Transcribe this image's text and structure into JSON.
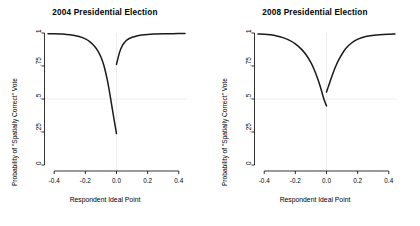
{
  "figure": {
    "background": "#ffffff",
    "curve_color": "#1a1a1a",
    "grid_color": "#e8e8e8"
  },
  "chart_data": [
    {
      "type": "line",
      "title": "2004 Presidential Election",
      "xlabel": "Respondent Ideal Point",
      "ylabel": "Probability of \"Spatially Correct\" Vote",
      "xlim": [
        -0.44,
        0.44
      ],
      "ylim": [
        0,
        1
      ],
      "xticks": [
        -0.4,
        -0.2,
        0.0,
        0.2,
        0.4
      ],
      "xtick_labels": [
        "-0.4",
        "-0.2",
        "0.0",
        "0.2",
        "0.4"
      ],
      "yticks": [
        0,
        0.25,
        0.5,
        0.75,
        1
      ],
      "ytick_labels": [
        "0",
        ".25",
        ".5",
        ".75",
        "1"
      ],
      "grid": true,
      "gridlines": {
        "horizontal": [
          0.5
        ],
        "vertical": [
          0.0
        ]
      },
      "legend": null,
      "discontinuity_at_x": 0.0,
      "series": [
        {
          "name": "left-branch-2004",
          "x": [
            -0.44,
            -0.4,
            -0.36,
            -0.32,
            -0.28,
            -0.24,
            -0.2,
            -0.17,
            -0.14,
            -0.12,
            -0.1,
            -0.08,
            -0.06,
            -0.04,
            -0.02,
            0.0
          ],
          "y": [
            0.995,
            0.994,
            0.992,
            0.989,
            0.983,
            0.973,
            0.955,
            0.933,
            0.898,
            0.865,
            0.818,
            0.75,
            0.65,
            0.52,
            0.375,
            0.238
          ]
        },
        {
          "name": "right-branch-2004",
          "x": [
            0.0,
            0.02,
            0.04,
            0.06,
            0.08,
            0.1,
            0.13,
            0.16,
            0.2,
            0.25,
            0.3,
            0.36,
            0.44
          ],
          "y": [
            0.762,
            0.855,
            0.91,
            0.94,
            0.957,
            0.968,
            0.978,
            0.984,
            0.989,
            0.992,
            0.994,
            0.995,
            0.996
          ]
        }
      ]
    },
    {
      "type": "line",
      "title": "2008 Presidential Election",
      "xlabel": "Respondent Ideal Point",
      "ylabel": "Probability of \"Spatially Correct\" Vote",
      "xlim": [
        -0.44,
        0.44
      ],
      "ylim": [
        0,
        1
      ],
      "xticks": [
        -0.4,
        -0.2,
        0.0,
        0.2,
        0.4
      ],
      "xtick_labels": [
        "-0.4",
        "-0.2",
        "0.0",
        "0.2",
        "0.4"
      ],
      "yticks": [
        0,
        0.25,
        0.5,
        0.75,
        1
      ],
      "ytick_labels": [
        "0",
        ".25",
        ".5",
        ".75",
        "1"
      ],
      "grid": true,
      "gridlines": {
        "horizontal": [
          0.5
        ],
        "vertical": [
          0.0
        ]
      },
      "legend": null,
      "discontinuity_at_x": 0.0,
      "series": [
        {
          "name": "left-branch-2008",
          "x": [
            -0.44,
            -0.4,
            -0.36,
            -0.32,
            -0.28,
            -0.24,
            -0.2,
            -0.16,
            -0.13,
            -0.1,
            -0.08,
            -0.06,
            -0.04,
            -0.02,
            -0.01,
            0.0
          ],
          "y": [
            0.993,
            0.991,
            0.986,
            0.978,
            0.965,
            0.946,
            0.918,
            0.876,
            0.833,
            0.775,
            0.725,
            0.665,
            0.595,
            0.512,
            0.478,
            0.448
          ]
        },
        {
          "name": "right-branch-2008",
          "x": [
            0.0,
            0.01,
            0.02,
            0.04,
            0.06,
            0.08,
            0.11,
            0.14,
            0.18,
            0.23,
            0.28,
            0.34,
            0.4,
            0.44
          ],
          "y": [
            0.552,
            0.588,
            0.622,
            0.69,
            0.75,
            0.8,
            0.86,
            0.903,
            0.941,
            0.966,
            0.979,
            0.987,
            0.991,
            0.992
          ]
        }
      ]
    }
  ]
}
